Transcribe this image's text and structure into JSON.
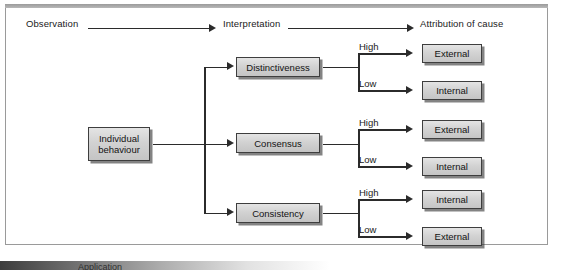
{
  "diagram": {
    "header": {
      "stage1": "Observation",
      "stage2": "Interpretation",
      "stage3": "Attribution of cause"
    },
    "source_node": {
      "line1": "Individual",
      "line2": "behaviour"
    },
    "criteria": [
      {
        "label": "Distinctiveness",
        "branches": [
          {
            "condition": "High",
            "outcome": "External"
          },
          {
            "condition": "Low",
            "outcome": "Internal"
          }
        ]
      },
      {
        "label": "Consensus",
        "branches": [
          {
            "condition": "High",
            "outcome": "External"
          },
          {
            "condition": "Low",
            "outcome": "Internal"
          }
        ]
      },
      {
        "label": "Consistency",
        "branches": [
          {
            "condition": "High",
            "outcome": "Internal"
          },
          {
            "condition": "Low",
            "outcome": "External"
          }
        ]
      }
    ],
    "footer_caption": "Application",
    "colors": {
      "node_fill": "#d4d4d4",
      "node_border": "#3e3e3e",
      "line": "#2b2b2b",
      "frame_border": "#9a9a9a",
      "text": "#1a1a1a"
    }
  }
}
